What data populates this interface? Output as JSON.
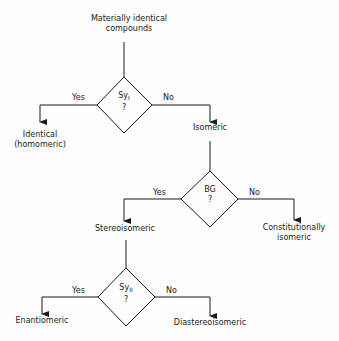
{
  "diagram": {
    "title_lines": [
      "Materially identical",
      "compounds"
    ],
    "decisions": [
      {
        "symbol": "Sy",
        "subscript": "I",
        "question": "?",
        "yes_label": "Yes",
        "no_label": "No",
        "yes_result": [
          "Identical",
          "(homomeric)"
        ],
        "no_result": [
          "Isomeric"
        ]
      },
      {
        "symbol": "BG",
        "subscript": "",
        "question": "?",
        "yes_label": "Yes",
        "no_label": "No",
        "yes_result": [
          "Stereoisomeric"
        ],
        "no_result": [
          "Constitutionally",
          "isomeric"
        ]
      },
      {
        "symbol": "Sy",
        "subscript": "II",
        "question": "?",
        "yes_label": "Yes",
        "no_label": "No",
        "yes_result": [
          "Enantiomeric"
        ],
        "no_result": [
          "Diastereoisomeric"
        ]
      }
    ],
    "colors": {
      "line": "#1a1a1a",
      "background": "#fefefe"
    }
  }
}
